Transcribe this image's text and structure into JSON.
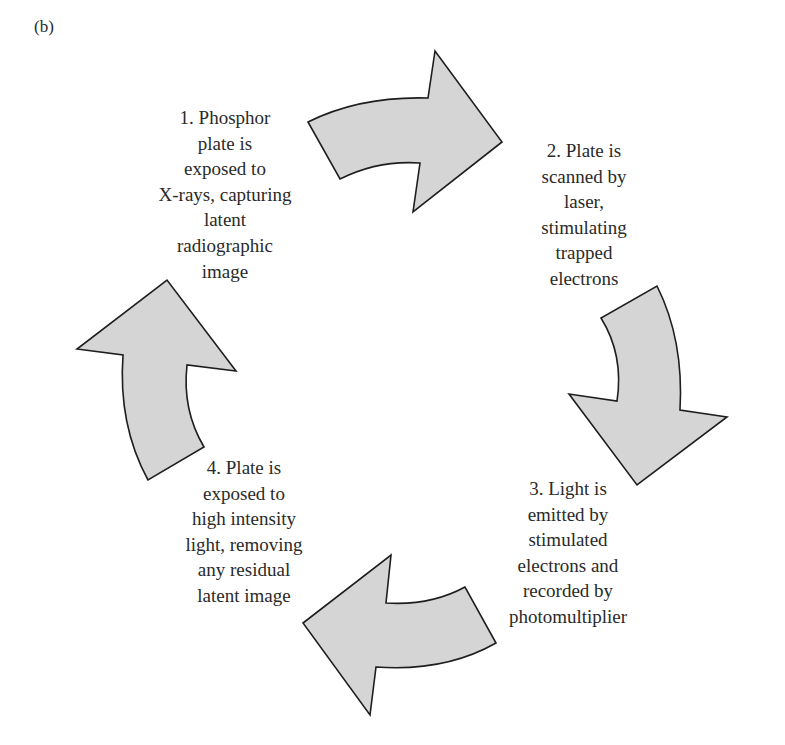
{
  "panel_label": "(b)",
  "colors": {
    "arrow_fill": "#d5d5d5",
    "arrow_stroke": "#1e1e1e",
    "text": "#2a2a2a",
    "background": "#ffffff"
  },
  "steps": [
    {
      "number": 1,
      "lines": [
        "1. Phosphor",
        "plate is",
        "exposed to",
        "X-rays, capturing",
        "latent",
        "radiographic",
        "image"
      ],
      "x": 225,
      "y": 105
    },
    {
      "number": 2,
      "lines": [
        "2. Plate is",
        "scanned by",
        "laser,",
        "stimulating",
        "trapped",
        "electrons"
      ],
      "x": 584,
      "y": 138
    },
    {
      "number": 3,
      "lines": [
        "3. Light is",
        "emitted by",
        "stimulated",
        "electrons and",
        "recorded by",
        "photomultiplier"
      ],
      "x": 568,
      "y": 476
    },
    {
      "number": 4,
      "lines": [
        "4. Plate is",
        "exposed to",
        "high intensity",
        "light, removing",
        "any residual",
        "latent image"
      ],
      "x": 244,
      "y": 455
    }
  ],
  "arrows": [
    {
      "name": "arrow-step1-to-step2",
      "direction": "right",
      "path": "M308,122 Q360,96 428,98 L435,51 L502,142 L413,212 L420,163 Q378,160 340,179 Z"
    },
    {
      "name": "arrow-step2-to-step3",
      "direction": "down",
      "path": "M657,286 Q684,340 680,410 L727,417 L637,485 L569,394 L617,401 Q624,355 601,318 Z"
    },
    {
      "name": "arrow-step3-to-step4",
      "direction": "left",
      "path": "M496,643 Q445,672 376,667 L370,715 L303,623 L391,555 L386,603 Q430,606 465,587 Z"
    },
    {
      "name": "arrow-step4-to-step1",
      "direction": "up",
      "path": "M148,480 Q118,425 123,355 L77,349 L167,280 L236,371 L187,365 Q182,410 204,447 Z"
    }
  ]
}
